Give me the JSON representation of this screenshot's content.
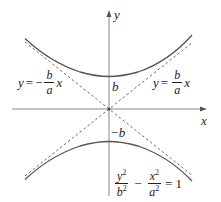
{
  "diagram": {
    "axes": {
      "x_label": "x",
      "y_label": "y"
    },
    "vertex_labels": {
      "top": "b",
      "bottom": "−b"
    },
    "asymptote_left": {
      "lhs": "y",
      "eq": "=",
      "sign": "−",
      "num": "b",
      "den": "a",
      "var": "x"
    },
    "asymptote_right": {
      "lhs": "y",
      "eq": "=",
      "num": "b",
      "den": "a",
      "var": "x"
    },
    "equation": {
      "term1_num": "y",
      "term1_den": "b",
      "minus": "−",
      "term2_num": "x",
      "term2_den": "a",
      "exp": "2",
      "rhs": "= 1"
    },
    "colors": {
      "curve": "#555555",
      "axis": "#777777",
      "asymptote": "#666666",
      "text": "#222222"
    }
  }
}
